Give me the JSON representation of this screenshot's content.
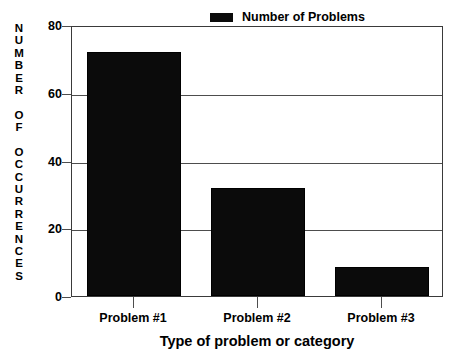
{
  "chart_data": {
    "type": "bar",
    "title": "",
    "xlabel": "Type of problem or category",
    "ylabel": "NUMBER OF OCCURRENCES",
    "categories": [
      "Problem #1",
      "Problem #2",
      "Problem #3"
    ],
    "values": [
      72,
      32,
      8.5
    ],
    "series": [
      {
        "name": "Number of Problems",
        "values": [
          72,
          32,
          8.5
        ],
        "color": "#0b0b0b"
      }
    ],
    "ylim": [
      0,
      80
    ],
    "ytick_labels": [
      "80",
      "60",
      "40",
      "20",
      "0"
    ],
    "ytick_values": [
      80,
      60,
      40,
      20,
      0
    ],
    "grid": true,
    "legend_position": "top-right"
  },
  "legend": {
    "label": "Number of Problems",
    "swatch_color": "#0b0b0b"
  },
  "axis": {
    "y_title_lines": [
      "N",
      "U",
      "M",
      "B",
      "E",
      "R",
      "",
      "O",
      "F",
      "",
      "O",
      "C",
      "C",
      "U",
      "R",
      "R",
      "E",
      "N",
      "C",
      "E",
      "S"
    ],
    "x_title": "Type of problem or category"
  },
  "colors": {
    "bar": "#0b0b0b",
    "grid": "#4d4d4d",
    "frame": "#3a3a3a",
    "background": "#ffffff",
    "text": "#000000"
  }
}
